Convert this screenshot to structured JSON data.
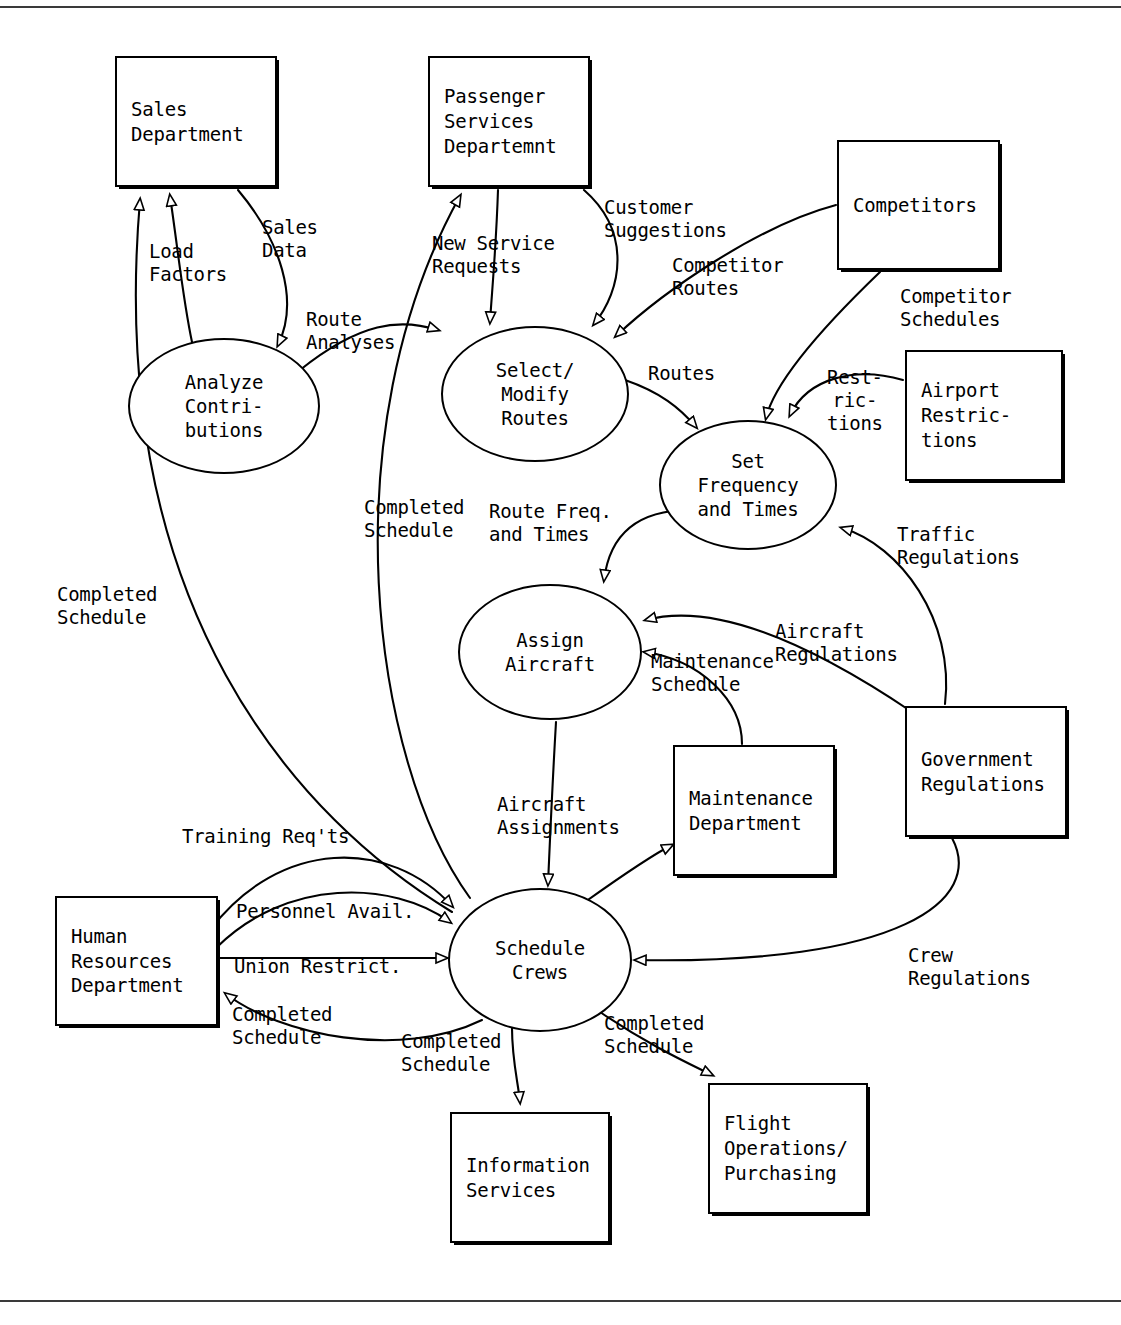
{
  "diagram": {
    "type": "data-flow-diagram",
    "entities": [
      {
        "id": "sales-department",
        "label": "Sales\nDepartment",
        "x": 115,
        "y": 56,
        "w": 162,
        "h": 131
      },
      {
        "id": "passenger-services",
        "label": "Passenger\nServices\nDepartemnt",
        "x": 428,
        "y": 56,
        "w": 162,
        "h": 131
      },
      {
        "id": "competitors",
        "label": "Competitors",
        "x": 837,
        "y": 140,
        "w": 163,
        "h": 130
      },
      {
        "id": "airport-restrictions",
        "label": "Airport\nRestric-\ntions",
        "x": 905,
        "y": 350,
        "w": 158,
        "h": 131
      },
      {
        "id": "government-regulations",
        "label": "Government\nRegulations",
        "x": 905,
        "y": 706,
        "w": 162,
        "h": 131
      },
      {
        "id": "maintenance-department",
        "label": "Maintenance\nDepartment",
        "x": 673,
        "y": 745,
        "w": 162,
        "h": 131
      },
      {
        "id": "human-resources-department",
        "label": "Human\nResources\nDepartment",
        "x": 55,
        "y": 896,
        "w": 163,
        "h": 130
      },
      {
        "id": "information-services",
        "label": "Information\nServices",
        "x": 450,
        "y": 1112,
        "w": 160,
        "h": 131
      },
      {
        "id": "flight-operations-purchasing",
        "label": "Flight\nOperations/\nPurchasing",
        "x": 708,
        "y": 1083,
        "w": 160,
        "h": 131
      }
    ],
    "processes": [
      {
        "id": "analyze-contributions",
        "label": "Analyze\nContri-\nbutions",
        "cx": 224,
        "cy": 406,
        "rx": 96,
        "ry": 68
      },
      {
        "id": "select-modify-routes",
        "label": "Select/\nModify\nRoutes",
        "cx": 535,
        "cy": 394,
        "rx": 94,
        "ry": 68
      },
      {
        "id": "set-frequency-and-times",
        "label": "Set\nFrequency\nand Times",
        "cx": 748,
        "cy": 485,
        "rx": 89,
        "ry": 65
      },
      {
        "id": "assign-aircraft",
        "label": "Assign\nAircraft",
        "cx": 550,
        "cy": 652,
        "rx": 92,
        "ry": 68
      },
      {
        "id": "schedule-crews",
        "label": "Schedule\nCrews",
        "cx": 540,
        "cy": 960,
        "rx": 92,
        "ry": 72
      }
    ],
    "flows": [
      {
        "id": "load-factors",
        "label": "Load\nFactors",
        "from": "analyze-contributions",
        "to": "sales-department"
      },
      {
        "id": "sales-data",
        "label": "Sales\nData",
        "from": "sales-department",
        "to": "analyze-contributions"
      },
      {
        "id": "route-analyses",
        "label": "Route\nAnalyses",
        "from": "analyze-contributions",
        "to": "select-modify-routes"
      },
      {
        "id": "new-service-requests",
        "label": "New Service\nRequests",
        "from": "passenger-services",
        "to": "select-modify-routes"
      },
      {
        "id": "customer-suggestions",
        "label": "Customer\nSuggestions",
        "from": "passenger-services",
        "to": "select-modify-routes"
      },
      {
        "id": "competitor-routes",
        "label": "Competitor\nRoutes",
        "from": "competitors",
        "to": "select-modify-routes"
      },
      {
        "id": "competitor-schedules",
        "label": "Competitor\nSchedules",
        "from": "competitors",
        "to": "set-frequency-and-times"
      },
      {
        "id": "routes",
        "label": "Routes",
        "from": "select-modify-routes",
        "to": "set-frequency-and-times"
      },
      {
        "id": "restrictions",
        "label": "Rest-\nric-\ntions",
        "from": "airport-restrictions",
        "to": "set-frequency-and-times"
      },
      {
        "id": "traffic-regulations",
        "label": "Traffic\nRegulations",
        "from": "government-regulations",
        "to": "set-frequency-and-times"
      },
      {
        "id": "route-freq-and-times",
        "label": "Route Freq.\nand Times",
        "from": "set-frequency-and-times",
        "to": "assign-aircraft"
      },
      {
        "id": "aircraft-regulations",
        "label": "Aircraft\nRegulations",
        "from": "government-regulations",
        "to": "assign-aircraft"
      },
      {
        "id": "maintenance-schedule",
        "label": "Maintenance\nSchedule",
        "from": "maintenance-department",
        "to": "assign-aircraft"
      },
      {
        "id": "aircraft-assignments",
        "label": "Aircraft\nAssignments",
        "from": "assign-aircraft",
        "to": "schedule-crews"
      },
      {
        "id": "training-reqts",
        "label": "Training Req'ts",
        "from": "human-resources-department",
        "to": "schedule-crews"
      },
      {
        "id": "personnel-avail",
        "label": "Personnel Avail.",
        "from": "human-resources-department",
        "to": "schedule-crews"
      },
      {
        "id": "union-restrict",
        "label": "Union Restrict.",
        "from": "human-resources-department",
        "to": "schedule-crews"
      },
      {
        "id": "crew-regulations",
        "label": "Crew\nRegulations",
        "from": "government-regulations",
        "to": "schedule-crews"
      },
      {
        "id": "completed-schedule-hr",
        "label": "Completed\nSchedule",
        "from": "schedule-crews",
        "to": "human-resources-department"
      },
      {
        "id": "completed-schedule-is",
        "label": "Completed\nSchedule",
        "from": "schedule-crews",
        "to": "information-services"
      },
      {
        "id": "completed-schedule-fo",
        "label": "Completed\nSchedule",
        "from": "schedule-crews",
        "to": "flight-operations-purchasing"
      },
      {
        "id": "completed-schedule-md",
        "label": "",
        "from": "schedule-crews",
        "to": "maintenance-department"
      },
      {
        "id": "completed-schedule-ps",
        "label": "Completed\nSchedule",
        "from": "schedule-crews",
        "to": "passenger-services"
      },
      {
        "id": "completed-schedule-sd",
        "label": "Completed\nSchedule",
        "from": "schedule-crews",
        "to": "sales-department"
      }
    ],
    "labels": [
      {
        "id": "lbl-load-factors",
        "text": "Load\nFactors",
        "x": 149,
        "y": 240
      },
      {
        "id": "lbl-sales-data",
        "text": "Sales\nData",
        "x": 262,
        "y": 216
      },
      {
        "id": "lbl-route-analyses",
        "text": "Route\nAnalyses",
        "x": 306,
        "y": 308
      },
      {
        "id": "lbl-new-service-requests",
        "text": "New Service\nRequests",
        "x": 432,
        "y": 232
      },
      {
        "id": "lbl-customer-suggestions",
        "text": "Customer\nSuggestions",
        "x": 604,
        "y": 196
      },
      {
        "id": "lbl-competitor-routes",
        "text": "Competitor\nRoutes",
        "x": 672,
        "y": 254
      },
      {
        "id": "lbl-competitor-schedules",
        "text": "Competitor\nSchedules",
        "x": 900,
        "y": 285
      },
      {
        "id": "lbl-routes",
        "text": "Routes",
        "x": 648,
        "y": 362
      },
      {
        "id": "lbl-restrictions",
        "text": "Rest-\nric-\ntions",
        "x": 827,
        "y": 366
      },
      {
        "id": "lbl-traffic-regulations",
        "text": "Traffic\nRegulations",
        "x": 897,
        "y": 523
      },
      {
        "id": "lbl-completed-schedule-ps",
        "text": "Completed\nSchedule",
        "x": 364,
        "y": 496
      },
      {
        "id": "lbl-route-freq",
        "text": "Route Freq.\nand Times",
        "x": 489,
        "y": 500
      },
      {
        "id": "lbl-aircraft-regulations",
        "text": "Aircraft\nRegulations",
        "x": 775,
        "y": 620
      },
      {
        "id": "lbl-maintenance-schedule",
        "text": "Maintenance\nSchedule",
        "x": 651,
        "y": 650
      },
      {
        "id": "lbl-completed-schedule-sd",
        "text": "Completed\nSchedule",
        "x": 57,
        "y": 583
      },
      {
        "id": "lbl-aircraft-assignments",
        "text": "Aircraft\nAssignments",
        "x": 497,
        "y": 793
      },
      {
        "id": "lbl-training-reqts",
        "text": "Training Req'ts",
        "x": 182,
        "y": 825
      },
      {
        "id": "lbl-personnel-avail",
        "text": "Personnel Avail.",
        "x": 236,
        "y": 900
      },
      {
        "id": "lbl-union-restrict",
        "text": "Union Restrict.",
        "x": 234,
        "y": 955
      },
      {
        "id": "lbl-crew-regulations",
        "text": "Crew\nRegulations",
        "x": 908,
        "y": 944
      },
      {
        "id": "lbl-completed-schedule-hr",
        "text": "Completed\nSchedule",
        "x": 232,
        "y": 1003
      },
      {
        "id": "lbl-completed-schedule-is",
        "text": "Completed\nSchedule",
        "x": 401,
        "y": 1030
      },
      {
        "id": "lbl-completed-schedule-fo",
        "text": "Completed\nSchedule",
        "x": 604,
        "y": 1012
      }
    ]
  }
}
